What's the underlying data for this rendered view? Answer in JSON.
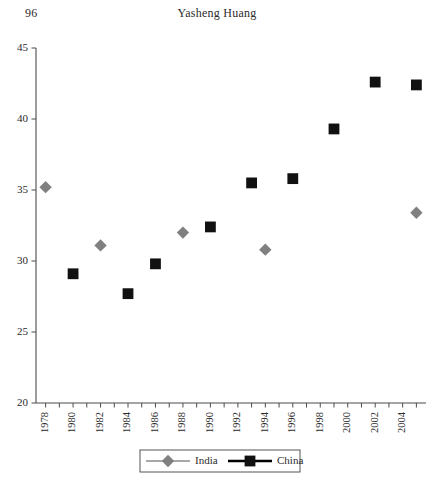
{
  "page": {
    "folio": "96",
    "running_head": "Yasheng Huang"
  },
  "chart_data": {
    "type": "scatter",
    "title": "",
    "xlabel": "",
    "ylabel": "",
    "xlim": [
      1977.3,
      2005.7
    ],
    "ylim": [
      20,
      45
    ],
    "grid": false,
    "legend_position": "bottom-center",
    "y_ticks": [
      20,
      25,
      30,
      35,
      40,
      45
    ],
    "x_tick_years": [
      1978,
      1979,
      1980,
      1981,
      1982,
      1983,
      1984,
      1985,
      1986,
      1987,
      1988,
      1989,
      1990,
      1991,
      1992,
      1993,
      1994,
      1995,
      1996,
      1997,
      1998,
      1999,
      2000,
      2001,
      2002,
      2003,
      2004,
      2005
    ],
    "x_labeled_years": [
      1978,
      1980,
      1982,
      1984,
      1986,
      1988,
      1990,
      1992,
      1994,
      1996,
      1998,
      2000,
      2002,
      2004
    ],
    "series": [
      {
        "name": "India",
        "marker": "diamond",
        "color": "#808080",
        "points": [
          {
            "x": 1978,
            "y": 35.2
          },
          {
            "x": 1982,
            "y": 31.1
          },
          {
            "x": 1988,
            "y": 32.0
          },
          {
            "x": 1994,
            "y": 30.8
          },
          {
            "x": 2005,
            "y": 33.4
          }
        ]
      },
      {
        "name": "China",
        "marker": "square",
        "color": "#111111",
        "points": [
          {
            "x": 1980,
            "y": 29.1
          },
          {
            "x": 1984,
            "y": 27.7
          },
          {
            "x": 1986,
            "y": 29.8
          },
          {
            "x": 1990,
            "y": 32.4
          },
          {
            "x": 1993,
            "y": 35.5
          },
          {
            "x": 1996,
            "y": 35.8
          },
          {
            "x": 1999,
            "y": 39.3
          },
          {
            "x": 2002,
            "y": 42.6
          },
          {
            "x": 2005,
            "y": 42.4
          }
        ]
      }
    ]
  }
}
